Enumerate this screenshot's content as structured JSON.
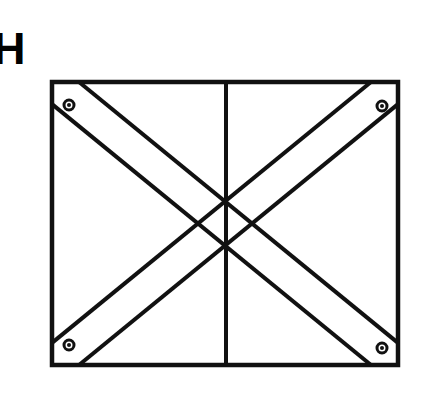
{
  "figure": {
    "label": "H",
    "type": "line-drawing",
    "background_color": "#ffffff",
    "stroke_color": "#111111",
    "canvas": {
      "width": 431,
      "height": 414
    }
  },
  "panel": {
    "name": "outer-frame",
    "x": 52,
    "y": 82,
    "width": 346,
    "height": 283,
    "stroke_width": 4.5
  },
  "center_divider": {
    "name": "vertical-center-line",
    "x": 226,
    "y_top": 82,
    "y_bottom": 365,
    "stroke_width": 4.0
  },
  "braces": [
    {
      "name": "brace-top-left-to-bottom-right",
      "direction": "descending",
      "start_corner": "top-left",
      "end_corner": "bottom-right",
      "band_offset": 27,
      "stroke_width": 4.0
    },
    {
      "name": "brace-bottom-left-to-top-right",
      "direction": "ascending",
      "start_corner": "bottom-left",
      "end_corner": "top-right",
      "band_offset": 27,
      "stroke_width": 4.0
    }
  ],
  "rivets": [
    {
      "name": "rivet-top-left",
      "cx": 69,
      "cy": 105,
      "r_outer": 5.0,
      "r_inner": 2.0
    },
    {
      "name": "rivet-top-right",
      "cx": 382,
      "cy": 106,
      "r_outer": 5.0,
      "r_inner": 2.0
    },
    {
      "name": "rivet-bottom-left",
      "cx": 69,
      "cy": 345,
      "r_outer": 5.0,
      "r_inner": 2.0
    },
    {
      "name": "rivet-bottom-right",
      "cx": 382,
      "cy": 348,
      "r_outer": 5.0,
      "r_inner": 2.0
    }
  ]
}
